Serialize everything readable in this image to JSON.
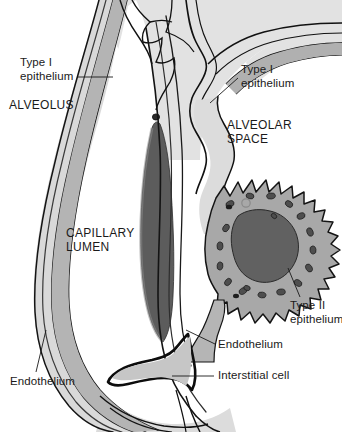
{
  "figure": {
    "background_color": "#ffffff",
    "text_color": "#1a1a1a"
  },
  "labels": {
    "type1_epithelium_left": "Type I\nepithelium",
    "alveolus": "ALVEOLUS",
    "type1_epithelium_right": "Type I\nepithelium",
    "alveolar_space": "ALVEOLAR\nSPACE",
    "capillary_lumen": "CAPILLARY\nLUMEN",
    "endothelium_left": "Endothelium",
    "endothelium_right": "Endothelium",
    "type2_epithelium": "Type II\nepithelium",
    "interstitial_cell": "Interstitial cell"
  },
  "structures": {
    "tissue_light": "#dedede",
    "tissue_mid": "#b9b9b9",
    "tissue_dark": "#9a9a9a",
    "erythrocyte": "#5c5c5c",
    "type2_cytoplasm": "#a5a5a5",
    "type2_nucleus": "#606060",
    "lamellar_body": "#4f4f4f",
    "outline": "#111111"
  },
  "annotations": [
    {
      "name": "type-i-epithelium-left",
      "leader": "from label right edge to alveolar wall at upper-left"
    },
    {
      "name": "type-i-epithelium-right",
      "leader": "from label left edge down-left to septal wall"
    },
    {
      "name": "endothelium-left",
      "leader": "vertical line up from label into capillary wall"
    },
    {
      "name": "endothelium-right",
      "leader": "from label left edge up-left into endothelial layer"
    },
    {
      "name": "type-ii-epithelium",
      "leader": "from label up-left into type II cell border"
    },
    {
      "name": "interstitial-cell",
      "leader": "horizontal line left from label into interstitium"
    }
  ]
}
